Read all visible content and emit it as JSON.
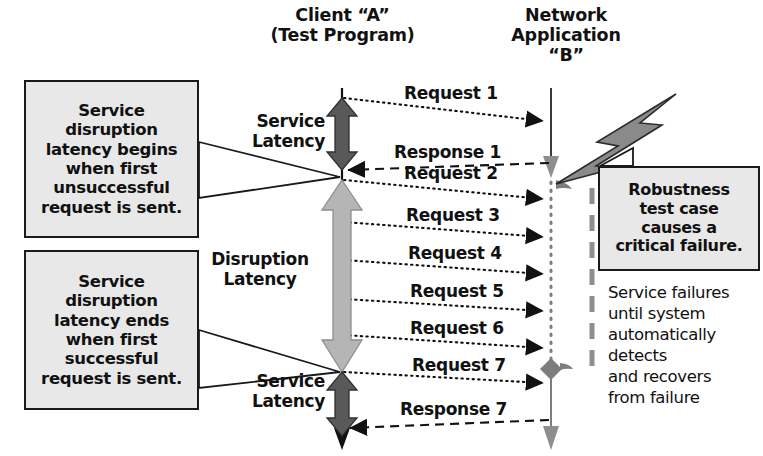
{
  "diagram": {
    "title_a": "Client “A”\n(Test Program)",
    "title_b": "Network\nApplication\n“B”",
    "lifelines": [
      {
        "id": "A",
        "name": "Client “A” (Test Program)"
      },
      {
        "id": "B",
        "name": "Network Application “B”"
      }
    ],
    "messages": [
      {
        "label": "Request 1",
        "kind": "request",
        "direction": "a-to-b",
        "y": 100
      },
      {
        "label": "Response 1",
        "kind": "response",
        "direction": "b-to-a",
        "y": 152
      },
      {
        "label": "Request 2",
        "kind": "request",
        "direction": "a-to-b",
        "y": 176
      },
      {
        "label": "Request 3",
        "kind": "request",
        "direction": "a-to-b",
        "y": 218
      },
      {
        "label": "Request 4",
        "kind": "request",
        "direction": "a-to-b",
        "y": 256
      },
      {
        "label": "Request 5",
        "kind": "request",
        "direction": "a-to-b",
        "y": 295
      },
      {
        "label": "Request 6",
        "kind": "request",
        "direction": "a-to-b",
        "y": 331
      },
      {
        "label": "Request 7",
        "kind": "request",
        "direction": "a-to-b",
        "y": 368
      },
      {
        "label": "Response 7",
        "kind": "response",
        "direction": "b-to-a",
        "y": 412
      }
    ],
    "latency_markers": [
      {
        "id": "service-latency-top",
        "label": "Service\nLatency",
        "shade": "dark"
      },
      {
        "id": "disruption-latency",
        "label": "Disruption\nLatency",
        "shade": "light"
      },
      {
        "id": "service-latency-bottom",
        "label": "Service\nLatency",
        "shade": "dark"
      }
    ],
    "callouts": [
      {
        "id": "begin",
        "text": "Service\ndisruption\nlatency begins\nwhen first\nunsuccessful\nrequest is sent."
      },
      {
        "id": "ends",
        "text": "Service\ndisruption\nlatency ends\nwhen first\nsuccessful\nrequest is sent."
      },
      {
        "id": "robustness",
        "text": "Robustness\ntest case\ncauses a\ncritical failure."
      }
    ],
    "failure_note": "Service failures\nuntil system\nautomatically\ndetects\nand recovers\nfrom failure",
    "icons": {
      "lightning": "lightning-bolt-icon",
      "failure_bracket": "failure-duration-bracket-icon"
    },
    "colors": {
      "ink": "#111111",
      "callout_fill": "#e8e8e8",
      "arrow_dark": "#595959",
      "arrow_light": "#b5b5b5",
      "bolt_fill": "#8a8a8a",
      "bolt_stroke": "#2b2b2b",
      "lifeline_gray": "#8e8e8e"
    }
  }
}
